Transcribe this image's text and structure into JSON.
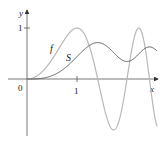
{
  "chart_data": {
    "type": "line",
    "title": "",
    "xlabel": "x",
    "ylabel": "y",
    "origin_label": "0",
    "x_ticks": [
      {
        "value": 1,
        "label": "1"
      }
    ],
    "y_ticks": [
      {
        "value": 1,
        "label": "1"
      }
    ],
    "xlim": [
      0,
      2.6
    ],
    "ylim": [
      -1,
      1.1
    ],
    "grid": false,
    "series": [
      {
        "name": "f",
        "formula": "sin(pi*x^2/2)",
        "color": "#b8b8b8",
        "x": [
          0,
          0.5,
          1,
          1.41,
          1.73,
          2,
          2.24,
          2.45,
          2.6
        ],
        "values": [
          0,
          0.38,
          1,
          0,
          -1,
          0,
          1,
          0,
          -0.8
        ]
      },
      {
        "name": "S",
        "formula": "integral_0^x sin(pi*t^2/2) dt",
        "color": "#555555",
        "x": [
          0,
          0.5,
          1,
          1.41,
          1.73,
          2,
          2.24,
          2.45,
          2.6
        ],
        "values": [
          0,
          0.06,
          0.44,
          0.71,
          0.55,
          0.34,
          0.53,
          0.62,
          0.55
        ]
      }
    ],
    "legend": "inline labels"
  }
}
